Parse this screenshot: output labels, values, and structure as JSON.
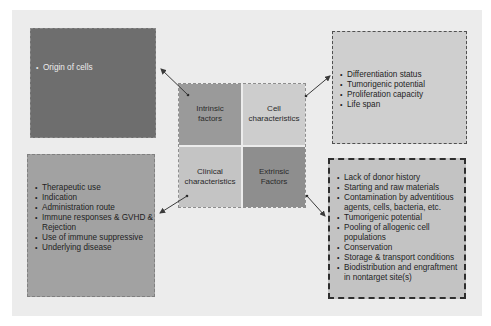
{
  "diagram": {
    "center": {
      "intrinsic": "Intrinsic\nfactors",
      "cell": "Cell\ncharacteristics",
      "clinical": "Clinical\ncharacteristics",
      "extrinsic": "Extrinsic\nFactors"
    },
    "intrinsic_box": {
      "items": [
        "Origin of cells"
      ]
    },
    "cell_box": {
      "items": [
        "Differentiation status",
        "Tumorigenic potential",
        "Proliferation capacity",
        "Life span"
      ]
    },
    "clinical_box": {
      "items": [
        "Therapeutic use",
        "Indication",
        "Administration route",
        "Immune responses & GVHD & Rejection",
        "Use of immune suppressive",
        "Underlying disease"
      ]
    },
    "extrinsic_box": {
      "items": [
        "Lack of donor history",
        "Starting and raw materials",
        "Contamination by adventitious agents, cells, bacteria, etc.",
        "Tumorigenic potential",
        "Pooling of allogenic cell populations",
        "Conservation",
        "Storage & transport conditions",
        "Biodistribution and engraftment in nontarget site(s)"
      ]
    },
    "colors": {
      "panel_bg": "#ececec",
      "intrinsic_box": "#6e6e6e",
      "clinical_box": "#a2a2a2",
      "cell_box": "#cfcfcf",
      "extrinsic_box": "#c3c3c3",
      "arrow": "#3a3a3a"
    }
  }
}
